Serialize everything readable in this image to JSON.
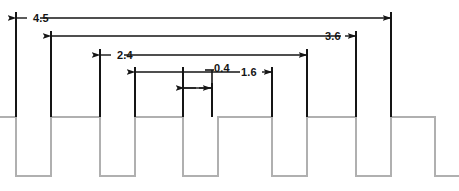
{
  "drawing": {
    "title": "Pulse Width Dimension Diagram",
    "type": "engineering-dimension-drawing",
    "units": "",
    "line_color_dimension": "#151515",
    "line_color_waveform": "#b0b0b0",
    "background": "#ffffff"
  },
  "dimensions": [
    {
      "id": "dim-4-5",
      "label": "4.5",
      "value": 4.5,
      "from_x": 16,
      "to_x": 391,
      "line_y": 18,
      "label_x": 33,
      "label_y": 22,
      "arrow_style": "outward",
      "label_position": "left-outside"
    },
    {
      "id": "dim-3-6",
      "label": "3.6",
      "value": 3.6,
      "from_x": 51,
      "to_x": 356,
      "line_y": 36,
      "label_x": 348,
      "label_y": 40,
      "arrow_style": "outward",
      "label_position": "right-outside"
    },
    {
      "id": "dim-2-4",
      "label": "2.4",
      "value": 2.4,
      "from_x": 100,
      "to_x": 307,
      "line_y": 55,
      "label_x": 117,
      "label_y": 59,
      "arrow_style": "outward",
      "label_position": "left-outside"
    },
    {
      "id": "dim-1-6",
      "label": "1.6",
      "value": 1.6,
      "from_x": 135,
      "to_x": 272,
      "line_y": 72,
      "label_x": 248,
      "label_y": 76,
      "arrow_style": "outward",
      "label_position": "right-outside"
    },
    {
      "id": "dim-0-4",
      "label": "0.4",
      "value": 0.4,
      "from_x": 183,
      "to_x": 212,
      "line_y": 88,
      "label_x": 216,
      "label_y": 72,
      "leader_from_x": 212,
      "leader_from_y": 72,
      "leader_to_x": 212,
      "leader_to_y": 88,
      "arrow_style": "inward",
      "label_position": "above-leader"
    }
  ],
  "extension_lines": [
    {
      "id": "ext-1",
      "x": 16,
      "top_y": 12,
      "bottom_y": 117
    },
    {
      "id": "ext-2",
      "x": 51,
      "top_y": 31,
      "bottom_y": 117
    },
    {
      "id": "ext-3",
      "x": 100,
      "top_y": 49,
      "bottom_y": 117
    },
    {
      "id": "ext-4",
      "x": 135,
      "top_y": 67,
      "bottom_y": 117
    },
    {
      "id": "ext-5",
      "x": 183,
      "top_y": 67,
      "bottom_y": 117
    },
    {
      "id": "ext-6",
      "x": 212,
      "top_y": 83,
      "bottom_y": 117
    },
    {
      "id": "ext-7",
      "x": 272,
      "top_y": 67,
      "bottom_y": 117
    },
    {
      "id": "ext-8",
      "x": 307,
      "top_y": 49,
      "bottom_y": 117
    },
    {
      "id": "ext-9",
      "x": 356,
      "top_y": 31,
      "bottom_y": 117
    },
    {
      "id": "ext-10",
      "x": 391,
      "top_y": 12,
      "bottom_y": 117
    }
  ],
  "waveform": {
    "id": "pulse-waveform",
    "high_y": 117,
    "low_y": 176,
    "start_x": 0,
    "end_x": 459,
    "stroke": "#b0b0b0",
    "stroke_width": 2,
    "pulses": [
      {
        "rise_x": 16,
        "fall_x": 51
      },
      {
        "rise_x": 100,
        "fall_x": 135
      },
      {
        "rise_x": 183,
        "fall_x": 218
      },
      {
        "rise_x": 272,
        "fall_x": 307
      },
      {
        "rise_x": 356,
        "fall_x": 391
      }
    ],
    "path": "M 0,117 L 16,117 L 16,176 L 51,176 L 51,117 L 100,117 L 100,176 L 135,176 L 135,117 L 183,117 L 183,176 L 218,176 L 218,117 L 272,117 L 272,176 L 307,176 L 307,117 L 356,117 L 356,176 L 391,176 L 391,117 L 435,117 L 435,176 L 459,176"
  }
}
